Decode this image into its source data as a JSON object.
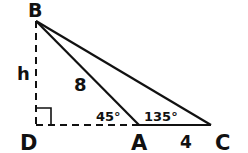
{
  "diagram": {
    "type": "geometry-triangle",
    "vertices": {
      "B": "B",
      "D": "D",
      "A": "A",
      "C": "C"
    },
    "labels": {
      "height": "h",
      "side_BA": "8",
      "side_AC": "4",
      "angle_BAD": "45°",
      "angle_BAC": "135°"
    },
    "colors": {
      "stroke": "#111111",
      "background": "#ffffff"
    }
  }
}
